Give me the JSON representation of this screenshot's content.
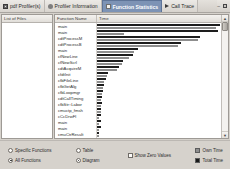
{
  "window": {
    "controls": [
      "minimize",
      "close"
    ]
  },
  "tabs": [
    {
      "label": "pdf Profiler(s)",
      "icon": "document-icon",
      "active": false
    },
    {
      "label": "Profiler Information",
      "icon": "info-icon",
      "active": false
    },
    {
      "label": "Function Statistics",
      "icon": "checkbox-icon",
      "active": true
    },
    {
      "label": "Call Trace",
      "icon": "play-icon",
      "active": false
    }
  ],
  "left_pane": {
    "header": "List of Files",
    "items": []
  },
  "grid": {
    "columns": [
      "Function Name",
      "Time"
    ]
  },
  "chart_data": {
    "type": "bar",
    "orientation": "horizontal",
    "title": "Function Statistics",
    "xlabel": "Time",
    "ylabel": "Function Name",
    "categories": [
      "main",
      "main",
      "cdtProcessM",
      "cdtProcessB",
      "main",
      "cfNewLine",
      "cfNewScrl",
      "cdtAcquireM",
      "cfdtInit",
      "cfbFileLine",
      "cfbGetAlg",
      "cfbLoopmgr",
      "cdtCallTiming",
      "cfbStr::Labor",
      "cmuctp_fmsh",
      "cCcDrwFl",
      "main",
      "main",
      "cmuCtrResult"
    ],
    "series": [
      {
        "name": "Total Time",
        "color": "#1d1d1d",
        "values": [
          100,
          98,
          84,
          68,
          33,
          29,
          21,
          18,
          9,
          7,
          6,
          5,
          4,
          4,
          3,
          3,
          3,
          3,
          2
        ]
      },
      {
        "name": "Own Time",
        "color": "#8e8e8e",
        "values": [
          97,
          22,
          82,
          66,
          30,
          26,
          20,
          16,
          8,
          6,
          5,
          4,
          3,
          3,
          3,
          2,
          2,
          2,
          2
        ]
      }
    ],
    "xlim": [
      0,
      100
    ],
    "grid": false,
    "legend_position": "bottom-right"
  },
  "controls": {
    "scope": {
      "specific": "Specific Functions",
      "all": "All Functions",
      "selected": "all"
    },
    "view": {
      "table": "Table",
      "diagram": "Diagram",
      "selected": "diagram"
    },
    "show_zero_values": {
      "label": "Show Zero Values",
      "checked": false
    }
  },
  "legend": {
    "own_time": "Own Time",
    "total_time": "Total Time",
    "own_color": "#8e8e8e",
    "total_color": "#1a1a1a"
  }
}
